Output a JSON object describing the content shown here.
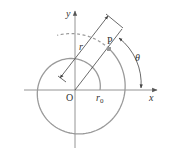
{
  "diagram": {
    "type": "polar-spiral-figure",
    "labels": {
      "x_axis": "x",
      "y_axis": "y",
      "origin": "O",
      "point": "P",
      "radius": "r",
      "initial_radius": "r",
      "initial_radius_sub": "0",
      "angle": "θ"
    },
    "colors": {
      "axes": "#888888",
      "spiral": "#9a9a9a",
      "dimension": "#444444",
      "point": "#999999",
      "text": "#333333"
    }
  }
}
